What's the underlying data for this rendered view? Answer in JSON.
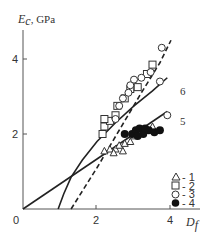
{
  "chart_data": {
    "type": "scatter",
    "title": "",
    "ylabel": "E_c, GPa",
    "ylabel_parts": {
      "main": "E",
      "sub": "c",
      "rest": ", GPa"
    },
    "xlabel": "D_f",
    "xlabel_parts": {
      "main": "D",
      "sub": "f"
    },
    "xlim": [
      0,
      5
    ],
    "ylim": [
      0,
      4.6
    ],
    "x_ticks": [
      "0",
      "2",
      "4"
    ],
    "y_ticks": [
      "2",
      "4"
    ],
    "grid": false,
    "legend_position": "lower-right",
    "legend": [
      {
        "marker": "triangle-open",
        "label": "- 1"
      },
      {
        "marker": "square-open",
        "label": "- 2"
      },
      {
        "marker": "circle-open",
        "label": "- 3"
      },
      {
        "marker": "circle-filled",
        "label": "- 4"
      }
    ],
    "series": [
      {
        "name": "1",
        "marker": "triangle-open",
        "points": [
          [
            2.2,
            1.55
          ],
          [
            2.35,
            1.6
          ],
          [
            2.5,
            1.6
          ],
          [
            2.6,
            1.7
          ],
          [
            2.75,
            1.75
          ],
          [
            2.9,
            1.8
          ],
          [
            2.45,
            1.5
          ],
          [
            2.7,
            1.55
          ],
          [
            3.0,
            1.95
          ],
          [
            3.3,
            2.1
          ],
          [
            3.5,
            2.2
          ]
        ]
      },
      {
        "name": "2",
        "marker": "square-open",
        "points": [
          [
            2.15,
            2.0
          ],
          [
            2.2,
            2.2
          ],
          [
            2.35,
            2.35
          ],
          [
            2.5,
            2.5
          ],
          [
            2.55,
            2.75
          ],
          [
            2.75,
            2.95
          ],
          [
            2.9,
            3.2
          ],
          [
            3.1,
            3.25
          ],
          [
            3.35,
            3.6
          ],
          [
            3.5,
            3.85
          ],
          [
            2.2,
            2.4
          ]
        ]
      },
      {
        "name": "3",
        "marker": "circle-open",
        "points": [
          [
            2.5,
            2.4
          ],
          [
            2.6,
            2.75
          ],
          [
            2.7,
            2.95
          ],
          [
            2.85,
            3.1
          ],
          [
            2.9,
            3.3
          ],
          [
            3.0,
            3.45
          ],
          [
            3.2,
            3.5
          ],
          [
            3.45,
            3.65
          ],
          [
            3.7,
            3.4
          ],
          [
            3.75,
            4.3
          ],
          [
            3.9,
            2.5
          ]
        ]
      },
      {
        "name": "4",
        "marker": "circle-filled",
        "points": [
          [
            2.75,
            2.0
          ],
          [
            2.95,
            2.0
          ],
          [
            3.05,
            2.1
          ],
          [
            3.15,
            2.15
          ],
          [
            3.25,
            2.0
          ],
          [
            3.4,
            2.1
          ],
          [
            3.55,
            2.05
          ],
          [
            3.7,
            2.1
          ],
          [
            3.1,
            1.95
          ],
          [
            3.3,
            2.15
          ]
        ]
      }
    ],
    "curves": [
      {
        "name": "5",
        "style": "solid",
        "x": [
          0,
          3.9
        ],
        "y": [
          0,
          2.6
        ]
      },
      {
        "name": "6",
        "style": "solid",
        "x": [
          0.95,
          1.1,
          1.3,
          1.6,
          2.0,
          2.5,
          3.0,
          3.5,
          3.9
        ],
        "y": [
          0,
          0.4,
          0.85,
          1.3,
          1.8,
          2.3,
          2.75,
          3.15,
          3.5
        ]
      },
      {
        "name": "dashed",
        "style": "dashed",
        "x": [
          1.3,
          2.0,
          2.6,
          3.2,
          3.7,
          4.0
        ],
        "y": [
          0,
          1.1,
          2.1,
          3.1,
          3.9,
          4.5
        ]
      }
    ],
    "curve_labels": [
      {
        "text": "6",
        "x": 4.25,
        "y": 3.65
      },
      {
        "text": "5",
        "x": 4.25,
        "y": 2.85
      }
    ]
  },
  "colors": {
    "ink": "#222222",
    "axis": "#555555",
    "text": "#333333"
  }
}
